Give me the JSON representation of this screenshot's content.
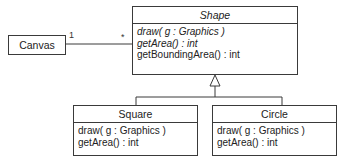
{
  "diagram": {
    "type": "UML class diagram",
    "classes": [
      {
        "id": "canvas",
        "name": "Canvas",
        "abstract": false,
        "operations": []
      },
      {
        "id": "shape",
        "name": "Shape",
        "abstract": true,
        "operations": [
          {
            "text": "draw( g : Graphics )",
            "abstract": true
          },
          {
            "text": "getArea() : int",
            "abstract": true
          },
          {
            "text": "getBoundingArea() : int",
            "abstract": false
          }
        ]
      },
      {
        "id": "square",
        "name": "Square",
        "abstract": false,
        "operations": [
          {
            "text": "draw( g : Graphics )",
            "abstract": false
          },
          {
            "text": "getArea() : int",
            "abstract": false
          }
        ]
      },
      {
        "id": "circle",
        "name": "Circle",
        "abstract": false,
        "operations": [
          {
            "text": "draw( g : Graphics )",
            "abstract": false
          },
          {
            "text": "getArea() : int",
            "abstract": false
          }
        ]
      }
    ],
    "association": {
      "from": "Canvas",
      "to": "Shape",
      "from_multiplicity": "1",
      "to_multiplicity": "*"
    },
    "generalizations": [
      {
        "child": "Square",
        "parent": "Shape"
      },
      {
        "child": "Circle",
        "parent": "Shape"
      }
    ],
    "colors": {
      "line": "#3a3a3a",
      "background": "#ffffff",
      "text": "#222222"
    }
  }
}
